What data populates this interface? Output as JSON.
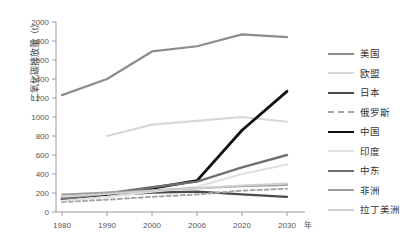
{
  "chart_data": {
    "type": "line",
    "title": "",
    "xlabel": "年",
    "ylabel": "二氧化碳排放量（t）",
    "ylim": [
      0,
      2000
    ],
    "ytick_step": 200,
    "yticks": [
      "0",
      "200",
      "400",
      "600",
      "800",
      "1000",
      "1200",
      "1400",
      "1600",
      "1800",
      "2000"
    ],
    "x": [
      1980,
      1990,
      2000,
      2006,
      2020,
      2030
    ],
    "xticks": [
      "1980",
      "1990",
      "2000",
      "2006",
      "2020",
      "2030"
    ],
    "x_unit_label": "年",
    "grid": false,
    "legend_position": "right",
    "series": [
      {
        "name": "美国",
        "color": "#8c8c8c",
        "width": 2.2,
        "dash": "none",
        "x": [
          1980,
          1990,
          2000,
          2006,
          2020,
          2030
        ],
        "values": [
          1230,
          1400,
          1690,
          1745,
          1870,
          1840
        ]
      },
      {
        "name": "欧盟",
        "color": "#d8d8d8",
        "width": 2.2,
        "dash": "none",
        "x": [
          1990,
          2000,
          2006,
          2020,
          2030
        ],
        "values": [
          800,
          920,
          960,
          1000,
          950
        ]
      },
      {
        "name": "日本",
        "color": "#4a4a4a",
        "width": 2.2,
        "dash": "none",
        "x": [
          1980,
          1990,
          2000,
          2006,
          2020,
          2030
        ],
        "values": [
          150,
          175,
          205,
          215,
          185,
          160
        ]
      },
      {
        "name": "俄罗斯",
        "color": "#a6a6a6",
        "width": 2.0,
        "dash": "4,3",
        "x": [
          1980,
          1990,
          2000,
          2006,
          2020,
          2030
        ],
        "values": [
          105,
          130,
          160,
          185,
          225,
          245
        ]
      },
      {
        "name": "中国",
        "color": "#111111",
        "width": 2.8,
        "dash": "none",
        "x": [
          1980,
          1990,
          2000,
          2006,
          2020,
          2030
        ],
        "values": [
          130,
          185,
          250,
          330,
          860,
          1270
        ]
      },
      {
        "name": "印度",
        "color": "#e0e0e0",
        "width": 2.2,
        "dash": "none",
        "x": [
          1980,
          1990,
          2000,
          2006,
          2020,
          2030
        ],
        "values": [
          120,
          160,
          215,
          265,
          400,
          500
        ]
      },
      {
        "name": "中东",
        "color": "#707070",
        "width": 2.4,
        "dash": "none",
        "x": [
          1980,
          1990,
          2000,
          2006,
          2020,
          2030
        ],
        "values": [
          140,
          195,
          260,
          320,
          470,
          600
        ]
      },
      {
        "name": "非洲",
        "color": "#9e9e9e",
        "width": 2.0,
        "dash": "none",
        "x": [
          1980,
          1990,
          2000,
          2006,
          2020,
          2030
        ],
        "values": [
          185,
          205,
          230,
          250,
          270,
          285
        ]
      },
      {
        "name": "拉丁美洲",
        "color": "#cfcfcf",
        "width": 2.0,
        "dash": "none",
        "x": [
          1980,
          1990,
          2000,
          2006,
          2020,
          2030
        ],
        "values": [
          160,
          190,
          225,
          250,
          280,
          300
        ]
      }
    ]
  }
}
